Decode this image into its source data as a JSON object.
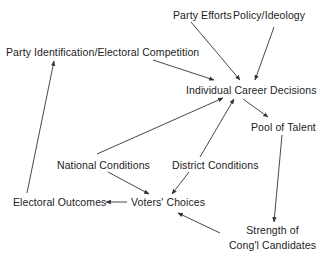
{
  "diagram": {
    "type": "causal-flow",
    "nodes": {
      "party_efforts": "Party Efforts",
      "policy_ideology": "Policy/Ideology",
      "party_identification": "Party Identification/Electoral Competition",
      "individual_career_decisions": "Individual Career Decisions",
      "pool_of_talent": "Pool of Talent",
      "national_conditions": "National Conditions",
      "district_conditions": "District Conditions",
      "electoral_outcomes": "Electoral Outcomes",
      "voters_choices": "Voters' Choices",
      "strength_line1": "Strength of",
      "strength_line2": "Cong'l Candidates"
    },
    "edges": [
      {
        "from": "Party Efforts",
        "to": "Individual Career Decisions"
      },
      {
        "from": "Policy/Ideology",
        "to": "Individual Career Decisions"
      },
      {
        "from": "Party Identification/Electoral Competition",
        "to": "Individual Career Decisions"
      },
      {
        "from": "National Conditions",
        "to": "Individual Career Decisions"
      },
      {
        "from": "District Conditions",
        "to": "Individual Career Decisions"
      },
      {
        "from": "Individual Career Decisions",
        "to": "Pool of Talent"
      },
      {
        "from": "Pool of Talent",
        "to": "Strength of Cong'l Candidates"
      },
      {
        "from": "Strength of Cong'l Candidates",
        "to": "Voters' Choices"
      },
      {
        "from": "National Conditions",
        "to": "Voters' Choices"
      },
      {
        "from": "District Conditions",
        "to": "Voters' Choices"
      },
      {
        "from": "Voters' Choices",
        "to": "Electoral Outcomes"
      },
      {
        "from": "Electoral Outcomes",
        "to": "Party Identification/Electoral Competition"
      }
    ],
    "line_color": "#333333"
  }
}
